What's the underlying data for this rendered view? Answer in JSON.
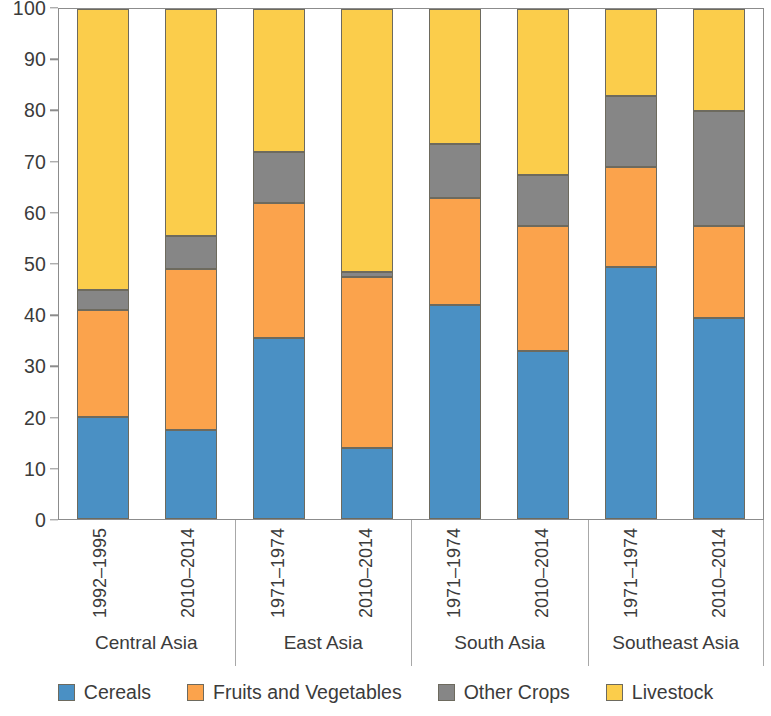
{
  "chart_data": {
    "type": "bar",
    "subtype": "stacked-bar-100-percent",
    "title": "",
    "xlabel": "",
    "ylabel": "",
    "ylim": [
      0,
      100
    ],
    "yticks": [
      0,
      10,
      20,
      30,
      40,
      50,
      60,
      70,
      80,
      90,
      100
    ],
    "grid": false,
    "legend_position": "bottom",
    "stack_order_bottom_to_top": [
      "Cereals",
      "Fruits and Vegetables",
      "Other Crops",
      "Livestock"
    ],
    "groups": [
      "Central Asia",
      "East Asia",
      "South Asia",
      "Southeast Asia"
    ],
    "categories": [
      "1992–1995",
      "2010–2014",
      "1971–1974",
      "2010–2014",
      "1971–1974",
      "2010–2014",
      "1971–1974",
      "2010–2014"
    ],
    "series": [
      {
        "name": "Cereals",
        "color": "#4a90c4",
        "values": [
          20.0,
          17.5,
          35.5,
          14.0,
          42.0,
          33.0,
          49.5,
          39.5
        ]
      },
      {
        "name": "Fruits and Vegetables",
        "color": "#fba34c",
        "values": [
          21.0,
          31.5,
          26.5,
          33.5,
          21.0,
          24.5,
          19.5,
          18.0
        ]
      },
      {
        "name": "Other Crops",
        "color": "#868686",
        "values": [
          4.0,
          6.5,
          10.0,
          1.0,
          10.5,
          10.0,
          14.0,
          22.5
        ]
      },
      {
        "name": "Livestock",
        "color": "#fbcd4b",
        "values": [
          55.0,
          44.5,
          28.0,
          51.5,
          26.5,
          32.5,
          17.0,
          20.0
        ]
      }
    ],
    "cumulative_tops": {
      "cereals": [
        20.0,
        17.5,
        35.5,
        14.0,
        42.0,
        33.0,
        49.5,
        39.5
      ],
      "fruits": [
        41.0,
        49.0,
        62.0,
        47.5,
        63.0,
        57.5,
        69.0,
        57.5
      ],
      "other": [
        45.0,
        55.5,
        72.0,
        48.5,
        73.5,
        67.5,
        83.0,
        80.0
      ],
      "livestock": [
        100.0,
        100.0,
        100.0,
        100.0,
        100.0,
        100.0,
        100.0,
        100.0
      ]
    }
  },
  "axis": {
    "y_tick_labels": [
      "100",
      "90",
      "80",
      "70",
      "60",
      "50",
      "40",
      "30",
      "20",
      "10",
      "0"
    ]
  },
  "groups": [
    {
      "label": "Central Asia",
      "bars": [
        {
          "period": "1992–1995"
        },
        {
          "period": "2010–2014"
        }
      ]
    },
    {
      "label": "East Asia",
      "bars": [
        {
          "period": "1971–1974"
        },
        {
          "period": "2010–2014"
        }
      ]
    },
    {
      "label": "South Asia",
      "bars": [
        {
          "period": "1971–1974"
        },
        {
          "period": "2010–2014"
        }
      ]
    },
    {
      "label": "Southeast Asia",
      "bars": [
        {
          "period": "1971–1974"
        },
        {
          "period": "2010–2014"
        }
      ]
    }
  ],
  "legend": {
    "items": [
      {
        "label": "Cereals",
        "color": "#4a90c4",
        "swatch": "cereals-swatch"
      },
      {
        "label": "Fruits and Vegetables",
        "color": "#fba34c",
        "swatch": "fruits-and-vegetables-swatch"
      },
      {
        "label": "Other Crops",
        "color": "#868686",
        "swatch": "other-crops-swatch"
      },
      {
        "label": "Livestock",
        "color": "#fbcd4b",
        "swatch": "livestock-swatch"
      }
    ]
  }
}
